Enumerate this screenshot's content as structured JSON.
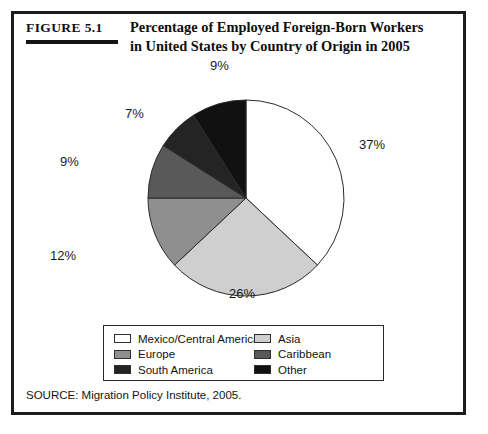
{
  "figure": {
    "tag": "FIGURE 5.1",
    "title": "Percentage of Employed Foreign-Born Workers in United States by Country of Origin in 2005",
    "source": "SOURCE: Migration Policy Institute, 2005."
  },
  "legend": {
    "items": [
      {
        "label": "Mexico/Central America",
        "color": "#ffffff"
      },
      {
        "label": "Asia",
        "color": "#cfcfcf"
      },
      {
        "label": "Europe",
        "color": "#8f8f8f"
      },
      {
        "label": "Caribbean",
        "color": "#595959"
      },
      {
        "label": "South America",
        "color": "#242424"
      },
      {
        "label": "Other",
        "color": "#111111"
      }
    ]
  },
  "chart_data": {
    "type": "pie",
    "title": "Percentage of Employed Foreign-Born Workers in United States by Country of Origin in 2005",
    "categories": [
      "Mexico/Central America",
      "Asia",
      "Europe",
      "Caribbean",
      "South America",
      "Other"
    ],
    "values": [
      37,
      26,
      12,
      9,
      7,
      9
    ],
    "labels": [
      "37%",
      "26%",
      "12%",
      "9%",
      "7%",
      "9%"
    ],
    "colors": [
      "#ffffff",
      "#cfcfcf",
      "#8f8f8f",
      "#595959",
      "#242424",
      "#111111"
    ],
    "start_angle_deg": 0,
    "direction": "clockwise",
    "legend_position": "bottom",
    "grid": false,
    "units": "percent"
  }
}
